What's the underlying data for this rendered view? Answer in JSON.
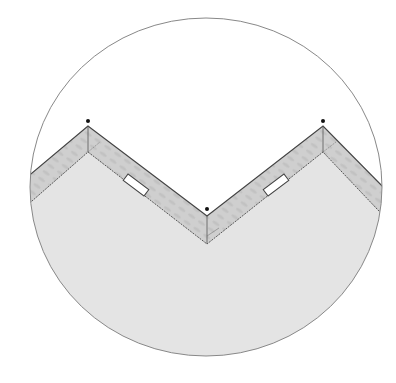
{
  "diagram": {
    "type": "sewing-detail",
    "colors": {
      "background": "#ffffff",
      "fabric": "#e4e4e4",
      "facing_band": "#cfcfcf",
      "outline": "#555555",
      "circle_border": "#888888",
      "marker_dot": "#111111",
      "buttonhole_fill": "#ffffff"
    },
    "points": [
      {
        "name": "left-peak",
        "x": 88,
        "y": 126
      },
      {
        "name": "center-valley",
        "x": 207,
        "y": 216
      },
      {
        "name": "right-peak",
        "x": 323,
        "y": 126
      }
    ],
    "markers": [
      {
        "name": "left-buttonhole"
      },
      {
        "name": "right-buttonhole"
      }
    ]
  }
}
